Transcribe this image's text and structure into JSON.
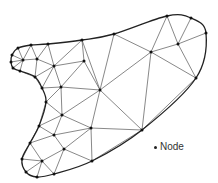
{
  "diagram": {
    "type": "triangular-mesh",
    "colors": {
      "edge": "#555555",
      "boundary": "#222222",
      "node": "#111111",
      "background": "#ffffff"
    },
    "nodes": [
      [
        18,
        48
      ],
      [
        31,
        45
      ],
      [
        48,
        44
      ],
      [
        82,
        40
      ],
      [
        114,
        34
      ],
      [
        167,
        16
      ],
      [
        191,
        18
      ],
      [
        206,
        33
      ],
      [
        178,
        44
      ],
      [
        151,
        52
      ],
      [
        196,
        78
      ],
      [
        142,
        130
      ],
      [
        12,
        55
      ],
      [
        11,
        62
      ],
      [
        13,
        68
      ],
      [
        23,
        60
      ],
      [
        37,
        59
      ],
      [
        20,
        71
      ],
      [
        35,
        77
      ],
      [
        54,
        66
      ],
      [
        84,
        61
      ],
      [
        42,
        88
      ],
      [
        61,
        87
      ],
      [
        100,
        90
      ],
      [
        46,
        102
      ],
      [
        62,
        115
      ],
      [
        39,
        126
      ],
      [
        54,
        135
      ],
      [
        91,
        128
      ],
      [
        30,
        143
      ],
      [
        64,
        149
      ],
      [
        22,
        159
      ],
      [
        42,
        161
      ],
      [
        92,
        161
      ],
      [
        26,
        172
      ],
      [
        37,
        177
      ],
      [
        54,
        174
      ]
    ],
    "boundary": [
      0,
      1,
      2,
      3,
      4,
      5,
      6,
      7,
      10,
      11,
      33,
      36,
      35,
      34,
      31,
      29,
      26,
      24,
      21,
      18,
      17,
      14,
      13,
      12,
      0
    ],
    "edges": [
      [
        0,
        15
      ],
      [
        1,
        15
      ],
      [
        1,
        16
      ],
      [
        2,
        16
      ],
      [
        2,
        19
      ],
      [
        3,
        19
      ],
      [
        3,
        20
      ],
      [
        12,
        15
      ],
      [
        13,
        15
      ],
      [
        14,
        15
      ],
      [
        15,
        16
      ],
      [
        15,
        17
      ],
      [
        16,
        18
      ],
      [
        16,
        19
      ],
      [
        17,
        18
      ],
      [
        18,
        19
      ],
      [
        19,
        20
      ],
      [
        19,
        21
      ],
      [
        19,
        22
      ],
      [
        18,
        21
      ],
      [
        21,
        22
      ],
      [
        20,
        22
      ],
      [
        20,
        23
      ],
      [
        22,
        23
      ],
      [
        3,
        23
      ],
      [
        4,
        23
      ],
      [
        4,
        9
      ],
      [
        5,
        9
      ],
      [
        5,
        8
      ],
      [
        6,
        8
      ],
      [
        7,
        8
      ],
      [
        8,
        9
      ],
      [
        8,
        10
      ],
      [
        9,
        10
      ],
      [
        9,
        23
      ],
      [
        9,
        11
      ],
      [
        10,
        11
      ],
      [
        23,
        11
      ],
      [
        22,
        24
      ],
      [
        22,
        25
      ],
      [
        24,
        25
      ],
      [
        23,
        25
      ],
      [
        25,
        26
      ],
      [
        25,
        27
      ],
      [
        25,
        28
      ],
      [
        24,
        26
      ],
      [
        26,
        27
      ],
      [
        27,
        28
      ],
      [
        26,
        29
      ],
      [
        29,
        27
      ],
      [
        27,
        30
      ],
      [
        28,
        30
      ],
      [
        28,
        11
      ],
      [
        28,
        33
      ],
      [
        30,
        33
      ],
      [
        30,
        32
      ],
      [
        29,
        32
      ],
      [
        29,
        31
      ],
      [
        31,
        32
      ],
      [
        32,
        34
      ],
      [
        32,
        35
      ],
      [
        32,
        36
      ],
      [
        30,
        36
      ],
      [
        23,
        28
      ],
      [
        33,
        11
      ]
    ]
  },
  "legend": {
    "marker": "bullet",
    "label": "Node"
  }
}
